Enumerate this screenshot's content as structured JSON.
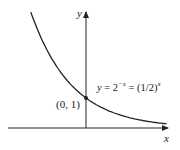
{
  "chart_data": {
    "type": "line",
    "title": "",
    "xlabel": "x",
    "ylabel": "y",
    "series": [
      {
        "name": "y = 2^-x = (1/2)^x",
        "function": "2^(-x)",
        "x": [
          -2,
          -1.5,
          -1,
          -0.5,
          0,
          0.5,
          1,
          1.5,
          2,
          2.5,
          2.8
        ],
        "values": [
          4,
          2.83,
          2,
          1.41,
          1,
          0.71,
          0.5,
          0.35,
          0.25,
          0.18,
          0.14
        ]
      }
    ],
    "annotations": [
      {
        "text": "(0, 1)",
        "x": 0,
        "y": 1,
        "marker": "point"
      },
      {
        "text": "y = 2^-x = (1/2)^x",
        "target": "curve"
      }
    ],
    "grid": false,
    "legend": "none",
    "xlim": [
      -2.8,
      2.9
    ],
    "ylim": [
      0,
      4.0
    ]
  },
  "labels": {
    "y_axis": "y",
    "x_axis": "x",
    "point": "(0, 1)",
    "eq_y": "y",
    "eq_eq1": " = 2",
    "eq_exp1": "−x",
    "eq_eq2": " = (1/2)",
    "eq_exp2": "x"
  },
  "colors": {
    "axis": "#222222",
    "curve": "#222222"
  }
}
